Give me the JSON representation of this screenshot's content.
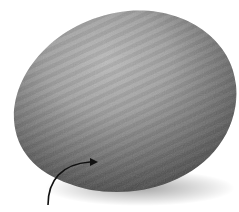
{
  "image": {
    "subject": "citrus-fruit",
    "description": "Grayscale photograph of an orange with dimpled peel texture and a curved annotation arrow pointing at the peel",
    "colors": {
      "background": "#ffffff",
      "highlight": "#b8b8b8",
      "midtone": "#8a8a8a",
      "shadow": "#4a4a4a",
      "arrow": "#111111"
    }
  },
  "annotation": {
    "type": "curved-arrow",
    "label": ""
  }
}
